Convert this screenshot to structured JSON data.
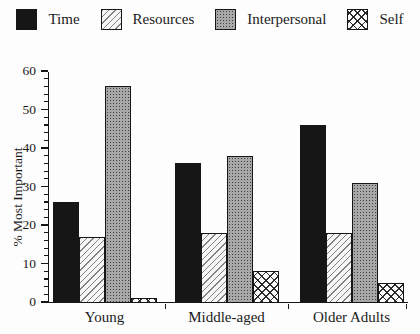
{
  "figure": {
    "background": "#fdfdfd"
  },
  "chart_data": {
    "type": "bar",
    "title": "",
    "xlabel": "",
    "ylabel": "% Most Important",
    "categories": [
      "Young",
      "Middle-aged",
      "Older Adults"
    ],
    "series": [
      {
        "name": "Time",
        "pattern": "solid-black",
        "values": [
          26,
          36,
          46
        ]
      },
      {
        "name": "Resources",
        "pattern": "diagonal-hatch",
        "values": [
          17,
          18,
          18
        ]
      },
      {
        "name": "Interpersonal",
        "pattern": "gray-stipple",
        "values": [
          56,
          38,
          31
        ]
      },
      {
        "name": "Self",
        "pattern": "crosshatch",
        "values": [
          1,
          8,
          5
        ]
      }
    ],
    "ylim": [
      0,
      60
    ],
    "y_major_step": 10,
    "y_minor_step": 2,
    "y_tick_labels": [
      "0",
      "10",
      "20",
      "30",
      "40",
      "50",
      "60"
    ],
    "legend_position": "top",
    "grid": false,
    "colors": {
      "axis": "#161616",
      "bar_outline": "#161616",
      "solid_fill": "#161616",
      "stipple_gray": "#a8a8a8",
      "background": "#fdfdfd"
    }
  }
}
